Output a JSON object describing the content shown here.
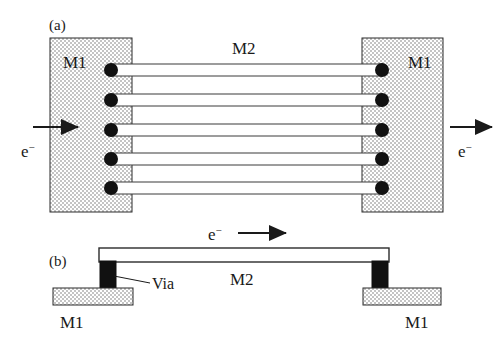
{
  "figure": {
    "caption_panels": [
      {
        "id": "a",
        "label": "(a)"
      },
      {
        "id": "b",
        "label": "(b)"
      }
    ],
    "colors": {
      "metal1_fill": "#d9d9d9",
      "metal1_stroke": "#2b2b2b",
      "metal2_fill": "#ffffff",
      "metal2_stroke": "#2b2b2b",
      "via_fill": "#111111",
      "arrow_color": "#1a1a1a",
      "text_color": "#1a1a1a",
      "background": "#ffffff"
    }
  },
  "panel_a": {
    "label": "(a)",
    "metal1_left_label": "M1",
    "metal1_right_label": "M1",
    "metal2_label": "M2",
    "electron_in_label": "e",
    "electron_in_charge": "−",
    "electron_out_label": "e",
    "electron_out_charge": "−",
    "via_count_left": 5,
    "via_count_right": 5,
    "line_count": 5,
    "via_rows_y": [
      70,
      100,
      130,
      159,
      188
    ],
    "metal1_left": {
      "x": 50,
      "y": 38,
      "width": 82,
      "height": 174
    },
    "metal1_right": {
      "x": 362,
      "y": 38,
      "width": 81,
      "height": 174
    },
    "metal2_lines": [
      {
        "x": 112,
        "y": 64,
        "width": 270,
        "height": 12
      },
      {
        "x": 112,
        "y": 94,
        "width": 270,
        "height": 12
      },
      {
        "x": 112,
        "y": 124,
        "width": 270,
        "height": 12
      },
      {
        "x": 112,
        "y": 153,
        "width": 270,
        "height": 12
      },
      {
        "x": 112,
        "y": 182,
        "width": 270,
        "height": 12
      }
    ],
    "arrow_in": {
      "x1": 33,
      "y": 127,
      "x2": 78
    },
    "arrow_out": {
      "x1": 450,
      "y": 127,
      "x2": 492
    }
  },
  "panel_b": {
    "label": "(b)",
    "metal1_left_label": "M1",
    "metal1_right_label": "M1",
    "metal2_label": "M2",
    "via_label": "Via",
    "electron_label": "e",
    "electron_charge": "−",
    "metal1_left": {
      "x": 53,
      "y": 288,
      "width": 80,
      "height": 17
    },
    "metal1_right": {
      "x": 363,
      "y": 288,
      "width": 78,
      "height": 17
    },
    "metal2_bar": {
      "x": 99,
      "y": 248,
      "width": 290,
      "height": 14
    },
    "via_left": {
      "x": 100,
      "y": 261,
      "width": 16,
      "height": 28
    },
    "via_right": {
      "x": 372,
      "y": 261,
      "width": 16,
      "height": 28
    },
    "arrow": {
      "x1": 238,
      "y": 233,
      "x2": 286
    },
    "leader": {
      "x1": 114,
      "y1": 276,
      "x2": 150,
      "y2": 282
    }
  },
  "legend_terms": {
    "metal1": "M1",
    "metal2": "M2",
    "via": "Via",
    "electron": "e−"
  }
}
